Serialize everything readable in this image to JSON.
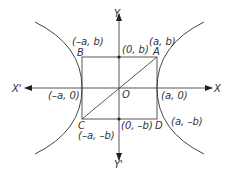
{
  "diagram": {
    "type": "hyperbola-rectangle",
    "axes": {
      "x_pos": "X",
      "x_neg": "X'",
      "y_pos": "Y",
      "y_neg": "Y'",
      "origin": "O"
    },
    "vertices": {
      "A": {
        "name": "A",
        "coord": "(a, b)"
      },
      "B": {
        "name": "B",
        "coord": "(–a, b)"
      },
      "C": {
        "name": "C",
        "coord": "(–a, –b)"
      },
      "D": {
        "name": "D",
        "coord": "(a, –b)"
      }
    },
    "intercepts": {
      "x_pos": "(a, 0)",
      "x_neg": "(–a, 0)",
      "y_pos": "(0, b)",
      "y_neg": "(0, –b)"
    },
    "colors": {
      "line": "#444444",
      "text": "#333333"
    }
  }
}
